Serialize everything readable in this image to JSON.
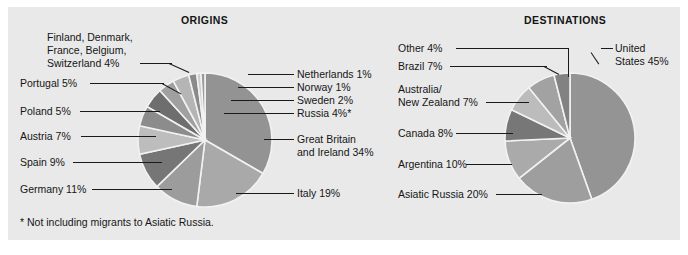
{
  "figure": {
    "background": "#e9e9e9",
    "page_background": "#ffffff",
    "footnote": "* Not including migrants to Asiatic Russia."
  },
  "charts": {
    "origins": {
      "title": "ORIGINS"
    },
    "destinations": {
      "title": "DESTINATIONS"
    }
  },
  "labels": {
    "origins": {
      "finland_group": "Finland, Denmark,",
      "finland_group2": "France, Belgium,",
      "finland_group3": "Switzerland  4%",
      "portugal": "Portugal  5%",
      "poland": "Poland  5%",
      "austria": "Austria  7%",
      "spain": "Spain  9%",
      "germany": "Germany  11%",
      "netherlands": "Netherlands  1%",
      "norway": "Norway  1%",
      "sweden": "Sweden  2%",
      "russia": "Russia  4%*",
      "gb1": "Great Britain",
      "gb2": "and Ireland  34%",
      "italy": "Italy  19%"
    },
    "destinations": {
      "other": "Other  4%",
      "brazil": "Brazil  7%",
      "anz1": "Australia/",
      "anz2": "New Zealand  7%",
      "canada": "Canada  8%",
      "argentina": "Argentina  10%",
      "asiatic_russia": "Asiatic Russia  20%",
      "us1": "United",
      "us2": "States 45%"
    }
  },
  "chart_data": [
    {
      "type": "pie",
      "title": "ORIGINS",
      "id": "origins",
      "unit": "percent",
      "note": "* Not including migrants to Asiatic Russia.",
      "start_angle_deg": -90,
      "direction": "clockwise",
      "categories": [
        "Great Britain and Ireland",
        "Italy",
        "Germany",
        "Spain",
        "Austria",
        "Poland",
        "Portugal",
        "Finland, Denmark, France, Belgium, Switzerland",
        "Russia",
        "Sweden",
        "Norway",
        "Netherlands"
      ],
      "values": [
        34,
        19,
        11,
        9,
        7,
        5,
        5,
        4,
        4,
        2,
        1,
        1
      ],
      "labels": [
        "Great Britain and Ireland  34%",
        "Italy  19%",
        "Germany  11%",
        "Spain  9%",
        "Austria  7%",
        "Poland  5%",
        "Portugal  5%",
        "Finland, Denmark, France, Belgium, Switzerland  4%",
        "Russia  4%*",
        "Sweden  2%",
        "Norway  1%",
        "Netherlands  1%"
      ],
      "colors": [
        "#939393",
        "#a9a9a9",
        "#9c9c9c",
        "#767676",
        "#bdbdbd",
        "#8c8c8c",
        "#6e6e6e",
        "#a0a0a0",
        "#b5b5b5",
        "#8a8a8a",
        "#cccccc",
        "#9a9a9a"
      ],
      "legend": "callout-lines"
    },
    {
      "type": "pie",
      "title": "DESTINATIONS",
      "id": "destinations",
      "unit": "percent",
      "start_angle_deg": -90,
      "direction": "clockwise",
      "categories": [
        "United States",
        "Asiatic Russia",
        "Argentina",
        "Canada",
        "Australia/New Zealand",
        "Brazil",
        "Other"
      ],
      "values": [
        45,
        20,
        10,
        8,
        7,
        7,
        4
      ],
      "labels": [
        "United States 45%",
        "Asiatic Russia  20%",
        "Argentina  10%",
        "Canada  8%",
        "Australia/New Zealand  7%",
        "Brazil  7%",
        "Other  4%"
      ],
      "colors": [
        "#949494",
        "#9e9e9e",
        "#aaaaaa",
        "#777777",
        "#bcbcbc",
        "#a2a2a2",
        "#828282"
      ],
      "legend": "callout-lines"
    }
  ],
  "geometry": {
    "origins_center": [
      205,
      140
    ],
    "origins_radius": 68,
    "destinations_center": [
      570,
      138
    ],
    "destinations_radius": 66
  }
}
